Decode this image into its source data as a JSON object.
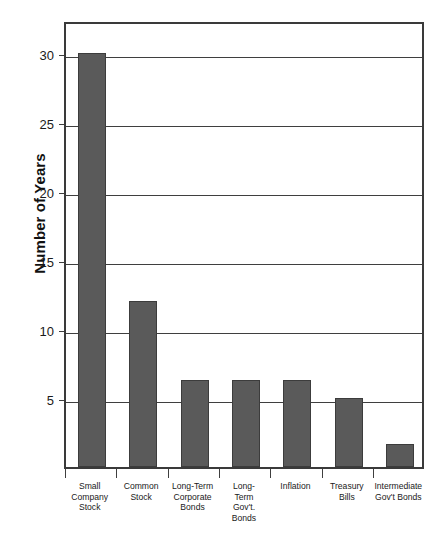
{
  "chart_data": {
    "type": "bar",
    "title": "",
    "subtitle": "",
    "xlabel": "",
    "ylabel": "Number of Years",
    "ylim": [
      0,
      32.4
    ],
    "grid": true,
    "legend": false,
    "orientation": "vertical",
    "bar_color": "#5a5a5a",
    "bar_edge_color": "#3c3c3c",
    "axis_color": "#3a3a3a",
    "background_color": "#ffffff",
    "yticks": [
      5,
      10,
      15,
      20,
      25,
      30
    ],
    "ytick_labels": [
      "5",
      "10",
      "15",
      "20",
      "25",
      "30"
    ],
    "categories": [
      "Small Company Stock",
      "Common Stock",
      "Long-Term Corporate Bonds",
      "Long-Term Gov't. Bonds",
      "Inflation",
      "Treasury Bills",
      "Intermediate Gov't Bonds"
    ],
    "category_label_lines": [
      [
        "Small",
        "Company",
        "Stock"
      ],
      [
        "Common",
        "Stock"
      ],
      [
        "Long-Term",
        "Corporate",
        "Bonds"
      ],
      [
        "Long-",
        "Term",
        "Gov't.",
        "Bonds"
      ],
      [
        "Inflation"
      ],
      [
        "Treasury",
        "Bills"
      ],
      [
        "Intermediate",
        "Gov't Bonds"
      ]
    ],
    "values": [
      30,
      12,
      6.3,
      6.3,
      6.3,
      5,
      1.7
    ]
  },
  "axis": {
    "y_title": "Number of Years"
  }
}
